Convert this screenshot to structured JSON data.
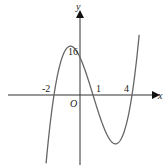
{
  "chart_data": {
    "type": "line",
    "title": "",
    "xlabel": "x",
    "ylabel": "y",
    "origin_label": "O",
    "function": "y = 2(x+2)(x-1)(x-4)",
    "x_tick_labels": [
      "-2",
      "1",
      "4"
    ],
    "y_tick_labels": [
      "16"
    ],
    "x_intercepts": [
      -2,
      1,
      4
    ],
    "y_intercept": 16,
    "xlim": [
      -3.1,
      4.6
    ],
    "grid": false,
    "legend": false,
    "series": [
      {
        "name": "f(x)",
        "color": "#555555",
        "x": [
          -2.5,
          -2,
          -1.5,
          -1,
          -0.5,
          0,
          0.5,
          1,
          1.5,
          2,
          2.5,
          3,
          3.5,
          4,
          4.5
        ],
        "values": [
          -29.25,
          0,
          16.25,
          20,
          15.75,
          16,
          5.25,
          0,
          -9.75,
          -16,
          -16.25,
          -10,
          0,
          0,
          15.75
        ]
      }
    ]
  },
  "labels": {
    "x_axis": "x",
    "y_axis": "y",
    "origin": "O",
    "tick_neg2": "-2",
    "tick_1": "1",
    "tick_4": "4",
    "tick_16": "16"
  }
}
